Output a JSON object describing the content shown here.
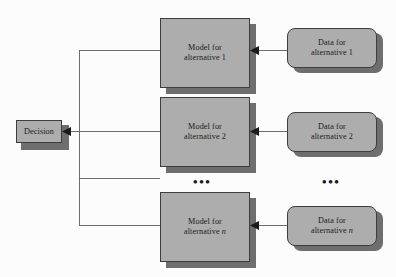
{
  "diagram": {
    "type": "block-flow-diagram",
    "colors": {
      "background": "#fcfcfc",
      "node_fill": "#adadad",
      "node_border": "#3d3d3d",
      "shadow": "#6e6e6e",
      "wire": "#5d5d5d",
      "text": "#1a1a1a"
    },
    "decision": {
      "label": "Decision",
      "shape": "rectangle"
    },
    "models": [
      {
        "line1": "Model for",
        "line2_prefix": "alternative ",
        "line2_var": "1",
        "var_italic": false,
        "shape": "rectangle"
      },
      {
        "line1": "Model for",
        "line2_prefix": "alternative ",
        "line2_var": "2",
        "var_italic": false,
        "shape": "rectangle"
      },
      {
        "line1": "Model for",
        "line2_prefix": "alternative ",
        "line2_var": "n",
        "var_italic": true,
        "shape": "rectangle"
      }
    ],
    "data_sources": [
      {
        "line1": "Data for",
        "line2_prefix": "alternative ",
        "line2_var": "1",
        "var_italic": false,
        "shape": "rounded-rectangle"
      },
      {
        "line1": "Data for",
        "line2_prefix": "alternative ",
        "line2_var": "2",
        "var_italic": false,
        "shape": "rounded-rectangle"
      },
      {
        "line1": "Data for",
        "line2_prefix": "alternative ",
        "line2_var": "n",
        "var_italic": true,
        "shape": "rounded-rectangle"
      }
    ],
    "ellipsis_markers": [
      {
        "text": "•••",
        "column": "models"
      },
      {
        "text": "•••",
        "column": "data"
      }
    ],
    "arrow_labels": {
      "model_to_decision": "",
      "data_to_model": ""
    }
  }
}
